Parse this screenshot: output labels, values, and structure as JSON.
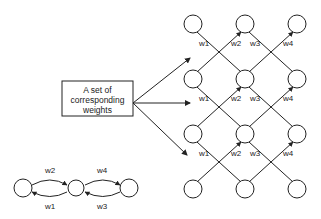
{
  "box": {
    "lines": [
      "A set of",
      "corresponding",
      "weights"
    ]
  },
  "grid": {
    "columns": 3,
    "rows": 4,
    "weight_rows": [
      [
        "w1",
        "w2",
        "w3",
        "w4"
      ],
      [
        "w1",
        "w2",
        "w3",
        "w4"
      ],
      [
        "w1",
        "w2",
        "w3",
        "w4"
      ]
    ]
  },
  "chain": {
    "nodes": 3,
    "top_labels": [
      "w2",
      "w4"
    ],
    "bottom_labels": [
      "w1",
      "w3"
    ]
  },
  "colors": {
    "stroke": "#222222",
    "background": "#ffffff"
  }
}
